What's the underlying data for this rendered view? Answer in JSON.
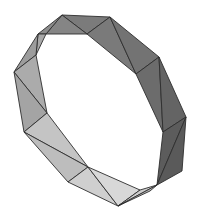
{
  "scene": {
    "subject": "triangulated polygonal ring",
    "background": "#ffffff",
    "edge_color": "#2e2e2e",
    "faces": [
      {
        "points": "62,15 110,17 87,34",
        "fill": "#7b7b7b"
      },
      {
        "points": "62,15 87,34 46,34",
        "fill": "#858585"
      },
      {
        "points": "62,15 46,34 38,34",
        "fill": "#8c8c8c"
      },
      {
        "points": "110,17 136,74 87,34",
        "fill": "#7a7a7a"
      },
      {
        "points": "110,17 159,57 136,74",
        "fill": "#737373"
      },
      {
        "points": "159,57 163,132 136,74",
        "fill": "#6c6c6c"
      },
      {
        "points": "159,57 186,117 163,132",
        "fill": "#646464"
      },
      {
        "points": "186,117 157,185 163,132",
        "fill": "#5c5c5c"
      },
      {
        "points": "186,117 182,171 157,185",
        "fill": "#5a5a5a"
      },
      {
        "points": "38,34 46,34 36,55",
        "fill": "#a8a8a8"
      },
      {
        "points": "38,34 36,55 14,72",
        "fill": "#9c9c9c"
      },
      {
        "points": "14,72 36,55 47,113",
        "fill": "#ababab"
      },
      {
        "points": "14,72 47,113 24,132",
        "fill": "#a4a4a4"
      },
      {
        "points": "24,132 47,113 88,167",
        "fill": "#c4c4c4"
      },
      {
        "points": "24,132 88,167 68,182",
        "fill": "#bdbdbd"
      },
      {
        "points": "68,182 88,167 118,206",
        "fill": "#cfcfcf"
      },
      {
        "points": "88,167 140,190 118,206",
        "fill": "#d8d8d8"
      },
      {
        "points": "118,206 140,190 157,185",
        "fill": "#cccccc"
      },
      {
        "points": "118,206 157,185 150,191",
        "fill": "#b8b8b8"
      }
    ]
  }
}
